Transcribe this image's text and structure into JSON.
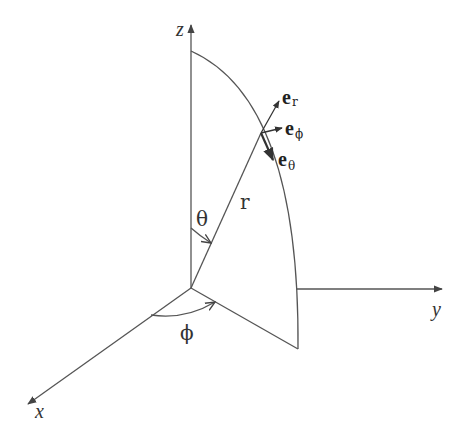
{
  "diagram": {
    "type": "spherical coordinate system",
    "axes": {
      "x": {
        "label": "x"
      },
      "y": {
        "label": "y"
      },
      "z": {
        "label": "z"
      }
    },
    "radius_label": "r",
    "angles": {
      "polar": "θ",
      "azimuthal": "ϕ"
    },
    "unit_vectors": [
      {
        "base": "e",
        "subscript": "r"
      },
      {
        "base": "e",
        "subscript": "ϕ"
      },
      {
        "base": "e",
        "subscript": "θ"
      }
    ],
    "colors": {
      "line": "#555555",
      "text": "#333333",
      "background": "#ffffff"
    }
  }
}
